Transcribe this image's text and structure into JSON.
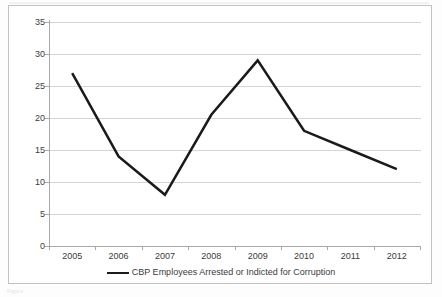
{
  "chart_data": {
    "type": "line",
    "title": "",
    "subtitle": "",
    "xlabel": "",
    "ylabel": "",
    "categories": [
      "2005",
      "2006",
      "2007",
      "2008",
      "2009",
      "2010",
      "2011",
      "2012"
    ],
    "series": [
      {
        "name": "CBP Employees Arrested or Indicted for Corruption",
        "values": [
          27,
          14,
          8,
          20.5,
          29,
          18,
          15,
          12
        ],
        "color": "#1a1a1a",
        "line_width": 2.5,
        "markers": "none"
      }
    ],
    "ylim": [
      0,
      35
    ],
    "y_ticks": [
      0,
      5,
      10,
      15,
      20,
      25,
      30,
      35
    ],
    "y_tick_labels": [
      "0",
      "5",
      "10",
      "15",
      "20",
      "25",
      "30",
      "35"
    ],
    "grid": {
      "horizontal": true,
      "vertical": false,
      "color": "#d6d6d6"
    },
    "legend": {
      "position": "bottom-center",
      "entries": [
        "CBP Employees Arrested or Indicted for Corruption"
      ]
    },
    "axis": {
      "x_type": "category",
      "x_tick_marks": true,
      "y_tick_marks": true,
      "axis_color": "#a8a8a8"
    },
    "plot_background": "#ffffff",
    "chart_border_color": "#c2c2c2"
  },
  "legend": {
    "label": "CBP Employees Arrested or Indicted for Corruption"
  },
  "artifacts": {
    "scan_caption": "Figure"
  }
}
